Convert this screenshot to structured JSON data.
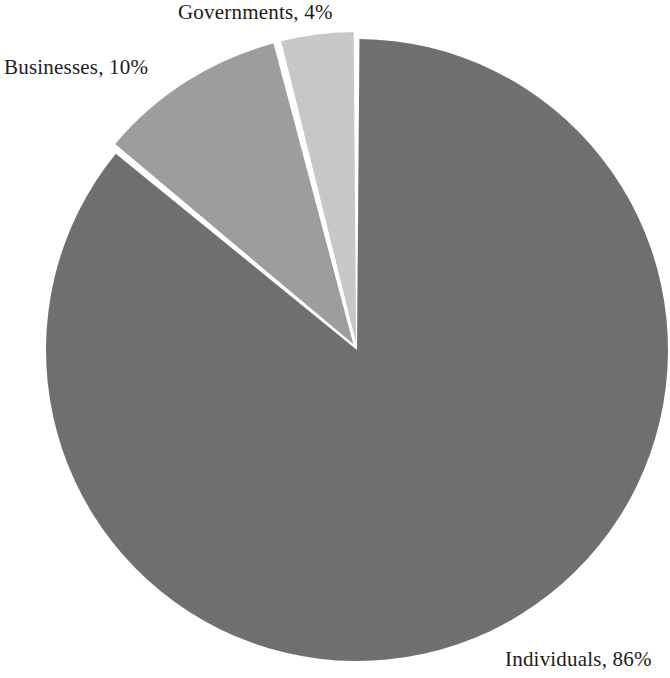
{
  "chart_data": {
    "type": "pie",
    "title": "",
    "subtitle": "",
    "xlabel": "",
    "ylabel": "",
    "legend_position": "none",
    "grid": false,
    "labels_inline": true,
    "label_format": "{name}, {value}%",
    "categories": [
      "Individuals",
      "Businesses",
      "Governments"
    ],
    "values": [
      86,
      10,
      4
    ],
    "units": "percent",
    "total": 100,
    "start_angle_deg": 0,
    "direction": "clockwise",
    "exploded_slices": [
      "Businesses",
      "Governments"
    ],
    "slices": [
      {
        "name": "Individuals",
        "value": 86,
        "label": "Individuals, 86%",
        "color": "#a9a9a9",
        "start_angle_deg": 0,
        "end_angle_deg": 309.6,
        "exploded": false
      },
      {
        "name": "Businesses",
        "value": 10,
        "label": "Businesses, 10%",
        "color": "#c9c9c9",
        "start_angle_deg": 309.6,
        "end_angle_deg": 345.6,
        "exploded": true
      },
      {
        "name": "Governments",
        "value": 4,
        "label": "Governments, 4%",
        "color": "#e3e3e3",
        "start_angle_deg": 345.6,
        "end_angle_deg": 360,
        "exploded": true
      }
    ],
    "background_color": "#ffffff",
    "separator_color": "#ffffff",
    "text_color": "#1c1c1c"
  },
  "labels": {
    "governments": "Governments, 4%",
    "businesses": "Businesses, 10%",
    "individuals": "Individuals, 86%"
  }
}
